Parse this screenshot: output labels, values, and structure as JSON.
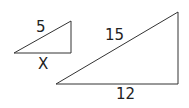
{
  "diagram": {
    "type": "similar-triangles",
    "stroke_color": "#333333",
    "small_triangle": {
      "points": "14,53 71,21 71,53",
      "hypotenuse_label": "5",
      "base_label": "X"
    },
    "large_triangle": {
      "points": "56,84 178,12 178,84",
      "hypotenuse_label": "15",
      "base_label": "12"
    }
  }
}
